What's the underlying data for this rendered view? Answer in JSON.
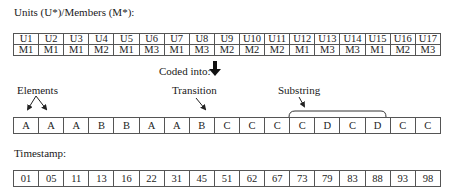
{
  "units_section": {
    "title": "Units (U*)/Members (M*):",
    "units": [
      "U1",
      "U2",
      "U3",
      "U4",
      "U5",
      "U6",
      "U7",
      "U8",
      "U9",
      "U10",
      "U11",
      "U12",
      "U13",
      "U14",
      "U15",
      "U16",
      "U17"
    ],
    "members": [
      "M1",
      "M1",
      "M1",
      "M2",
      "M1",
      "M3",
      "M1",
      "M3",
      "M2",
      "M2",
      "M2",
      "M1",
      "M3",
      "M3",
      "M1",
      "M2",
      "M3"
    ]
  },
  "coded_into": {
    "label": "Coded into:",
    "icon": "thick-down-arrow-icon"
  },
  "annotations": {
    "elements": "Elements",
    "transition": "Transition",
    "substring": "Substring"
  },
  "sequence": [
    "A",
    "A",
    "A",
    "B",
    "B",
    "A",
    "A",
    "B",
    "C",
    "C",
    "C",
    "C",
    "D",
    "C",
    "D",
    "C",
    "C"
  ],
  "timestamp_section": {
    "title": "Timestamp:",
    "values": [
      "01",
      "05",
      "11",
      "13",
      "16",
      "22",
      "31",
      "45",
      "51",
      "62",
      "67",
      "73",
      "79",
      "83",
      "88",
      "93",
      "98"
    ]
  }
}
